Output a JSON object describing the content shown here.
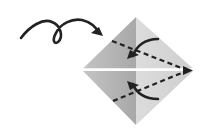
{
  "diagram": {
    "type": "origami-instruction",
    "elements": [
      {
        "name": "turn-over-arrow",
        "description": "looping arrow indicating turn model over"
      },
      {
        "name": "square-base-diamond",
        "description": "paper diamond split horizontally with center crease"
      },
      {
        "name": "upper-fold-line",
        "description": "dashed valley fold from upper-left edge to right tip"
      },
      {
        "name": "lower-fold-line",
        "description": "dashed valley fold from lower-left edge to right tip"
      },
      {
        "name": "upper-fold-arrow",
        "description": "curved arrow folding upper flap down"
      },
      {
        "name": "lower-fold-arrow",
        "description": "curved arrow folding lower flap up"
      }
    ],
    "colors": {
      "paper_left": "#b3b3b3",
      "paper_right": "#d6d6d6",
      "ink": "#222222",
      "gap": "#ffffff"
    }
  }
}
